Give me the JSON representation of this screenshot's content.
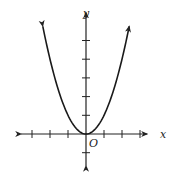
{
  "chart_data": {
    "type": "line",
    "title": "",
    "function": "y = x^2",
    "series": [
      {
        "name": "parabola",
        "x": [
          -2.4,
          -2,
          -1.5,
          -1,
          -0.5,
          0,
          0.5,
          1,
          1.5,
          2,
          2.4
        ],
        "y": [
          5.76,
          4,
          2.25,
          1,
          0.25,
          0,
          0.25,
          1,
          2.25,
          4,
          5.76
        ]
      }
    ],
    "xlabel": "x",
    "ylabel": "y",
    "origin_label": "O",
    "xlim": [
      -3.6,
      3.4
    ],
    "ylim": [
      -1.7,
      6.5
    ],
    "x_ticks": [
      -3,
      -2,
      -1,
      1,
      2,
      3
    ],
    "y_ticks": [
      -1,
      1,
      2,
      3,
      4,
      5
    ],
    "grid": false,
    "legend": "none"
  }
}
